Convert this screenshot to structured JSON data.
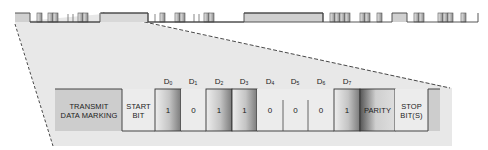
{
  "diagram": {
    "segments": [
      {
        "id": "mark",
        "label": "TRANSMIT DATA MARKING",
        "line1": "TRANSMIT",
        "line2": "DATA MARKING",
        "level": "high"
      },
      {
        "id": "start",
        "label": "START BIT",
        "line1": "START",
        "line2": "BIT",
        "level": "low"
      },
      {
        "id": "d0",
        "name": "D",
        "sub": "0",
        "value": "1"
      },
      {
        "id": "d1",
        "name": "D",
        "sub": "1",
        "value": "0"
      },
      {
        "id": "d2",
        "name": "D",
        "sub": "2",
        "value": "1"
      },
      {
        "id": "d3",
        "name": "D",
        "sub": "3",
        "value": "1"
      },
      {
        "id": "d4",
        "name": "D",
        "sub": "4",
        "value": "0"
      },
      {
        "id": "d5",
        "name": "D",
        "sub": "5",
        "value": "0"
      },
      {
        "id": "d6",
        "name": "D",
        "sub": "6",
        "value": "0"
      },
      {
        "id": "d7",
        "name": "D",
        "sub": "7",
        "value": "1"
      },
      {
        "id": "parity",
        "label": "PARITY",
        "level": "high"
      },
      {
        "id": "stop",
        "label": "STOP BIT(S)",
        "line1": "STOP",
        "line2": "BIT(S)",
        "level": "low"
      }
    ],
    "colors": {
      "background": "#ffffff",
      "zoom_panel": "#e6e6e6",
      "mark_fill": "#cfcfcf",
      "line": "#444444",
      "dashed": "#333333"
    }
  }
}
